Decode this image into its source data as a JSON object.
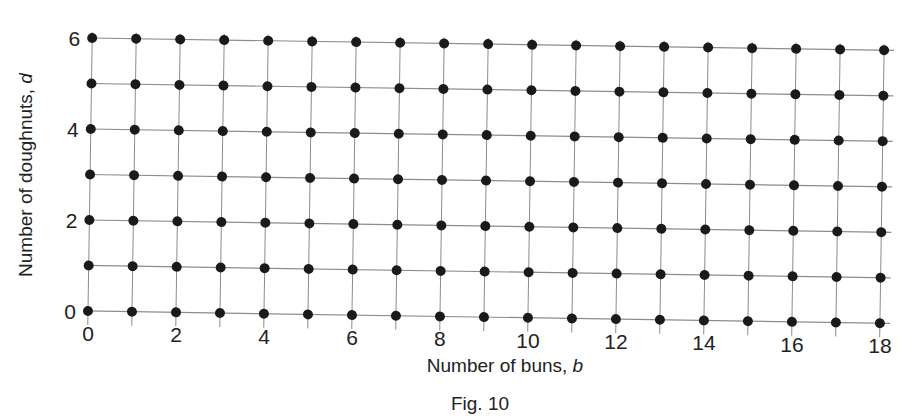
{
  "figure": {
    "caption": "Fig. 10",
    "x_axis_title_prefix": "Number of buns, ",
    "x_axis_title_var": "b",
    "y_axis_title_prefix": "Number of doughnuts, ",
    "y_axis_title_var": "d"
  },
  "chart_data": {
    "type": "scatter",
    "title": "",
    "subtitle": "",
    "xlabel": "Number of buns, b",
    "ylabel": "Number of doughnuts, d",
    "xlim": [
      0,
      18
    ],
    "ylim": [
      0,
      6
    ],
    "xticks": [
      0,
      2,
      4,
      6,
      8,
      10,
      12,
      14,
      16,
      18
    ],
    "yticks": [
      0,
      2,
      4,
      6
    ],
    "xtick_labels": [
      "0",
      "2",
      "4",
      "6",
      "8",
      "10",
      "12",
      "14",
      "16",
      "18"
    ],
    "ytick_labels": [
      "0",
      "2",
      "4",
      "6"
    ],
    "x_minor_step": 1,
    "y_minor_step": 1,
    "grid": true,
    "grid_color": "#8c8c8c",
    "legend": false,
    "legend_position": "none",
    "marker": "filled-circle",
    "marker_color": "#1a1a1a",
    "marker_size_px": 10,
    "point_count": 133,
    "x": [
      0,
      1,
      2,
      3,
      4,
      5,
      6,
      7,
      8,
      9,
      10,
      11,
      12,
      13,
      14,
      15,
      16,
      17,
      18
    ],
    "y": [
      0,
      1,
      2,
      3,
      4,
      5,
      6
    ],
    "series": [
      {
        "name": "d = 0",
        "x": [
          0,
          1,
          2,
          3,
          4,
          5,
          6,
          7,
          8,
          9,
          10,
          11,
          12,
          13,
          14,
          15,
          16,
          17,
          18
        ],
        "values": [
          0,
          0,
          0,
          0,
          0,
          0,
          0,
          0,
          0,
          0,
          0,
          0,
          0,
          0,
          0,
          0,
          0,
          0,
          0
        ]
      },
      {
        "name": "d = 1",
        "x": [
          0,
          1,
          2,
          3,
          4,
          5,
          6,
          7,
          8,
          9,
          10,
          11,
          12,
          13,
          14,
          15,
          16,
          17,
          18
        ],
        "values": [
          1,
          1,
          1,
          1,
          1,
          1,
          1,
          1,
          1,
          1,
          1,
          1,
          1,
          1,
          1,
          1,
          1,
          1,
          1
        ]
      },
      {
        "name": "d = 2",
        "x": [
          0,
          1,
          2,
          3,
          4,
          5,
          6,
          7,
          8,
          9,
          10,
          11,
          12,
          13,
          14,
          15,
          16,
          17,
          18
        ],
        "values": [
          2,
          2,
          2,
          2,
          2,
          2,
          2,
          2,
          2,
          2,
          2,
          2,
          2,
          2,
          2,
          2,
          2,
          2,
          2
        ]
      },
      {
        "name": "d = 3",
        "x": [
          0,
          1,
          2,
          3,
          4,
          5,
          6,
          7,
          8,
          9,
          10,
          11,
          12,
          13,
          14,
          15,
          16,
          17,
          18
        ],
        "values": [
          3,
          3,
          3,
          3,
          3,
          3,
          3,
          3,
          3,
          3,
          3,
          3,
          3,
          3,
          3,
          3,
          3,
          3,
          3
        ]
      },
      {
        "name": "d = 4",
        "x": [
          0,
          1,
          2,
          3,
          4,
          5,
          6,
          7,
          8,
          9,
          10,
          11,
          12,
          13,
          14,
          15,
          16,
          17,
          18
        ],
        "values": [
          4,
          4,
          4,
          4,
          4,
          4,
          4,
          4,
          4,
          4,
          4,
          4,
          4,
          4,
          4,
          4,
          4,
          4,
          4
        ]
      },
      {
        "name": "d = 5",
        "x": [
          0,
          1,
          2,
          3,
          4,
          5,
          6,
          7,
          8,
          9,
          10,
          11,
          12,
          13,
          14,
          15,
          16,
          17,
          18
        ],
        "values": [
          5,
          5,
          5,
          5,
          5,
          5,
          5,
          5,
          5,
          5,
          5,
          5,
          5,
          5,
          5,
          5,
          5,
          5,
          5
        ]
      },
      {
        "name": "d = 6",
        "x": [
          0,
          1,
          2,
          3,
          4,
          5,
          6,
          7,
          8,
          9,
          10,
          11,
          12,
          13,
          14,
          15,
          16,
          17,
          18
        ],
        "values": [
          6,
          6,
          6,
          6,
          6,
          6,
          6,
          6,
          6,
          6,
          6,
          6,
          6,
          6,
          6,
          6,
          6,
          6,
          6
        ]
      }
    ]
  },
  "geometry": {
    "origin_x_px": 88,
    "origin_y_px": 311,
    "x_unit_px": 44,
    "y_unit_px": 45.5,
    "tilt_deg": 0.88
  }
}
